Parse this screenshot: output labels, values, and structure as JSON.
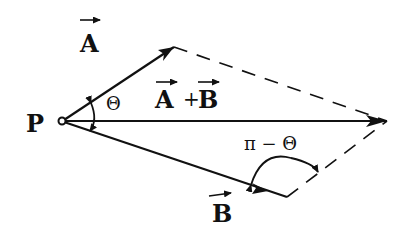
{
  "diagram": {
    "type": "vector-addition-parallelogram",
    "origin_label": "P",
    "vectors": [
      {
        "name": "A",
        "label": "A",
        "vector_arrow": true
      },
      {
        "name": "B",
        "label": "B",
        "vector_arrow": true
      },
      {
        "name": "A+B",
        "label_left": "A",
        "label_op": "+",
        "label_right": "B",
        "vector_arrow": true
      }
    ],
    "angle_between": {
      "label": "Θ"
    },
    "supplementary_angle": {
      "label": "π − Θ"
    },
    "colors": {
      "ink": "#111111",
      "background": "#ffffff"
    }
  }
}
